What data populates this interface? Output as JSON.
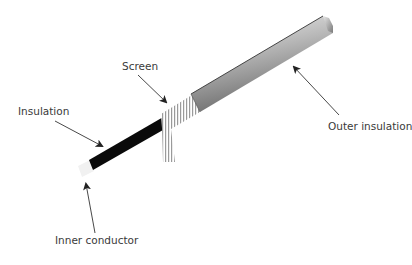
{
  "diagram": {
    "labels": {
      "insulation": "Insulation",
      "screen": "Screen",
      "outer_insulation": "Outer insulation",
      "inner_conductor": "Inner conductor"
    },
    "colors": {
      "outer_insulation_light": "#f2f2f2",
      "outer_insulation_dark": "#6e6e6e",
      "insulation": "#0a0a0a",
      "screen": "#9a9a9a",
      "inner_conductor": "#f1f1f1",
      "arrow": "#333333",
      "text": "#3a3a3a"
    }
  }
}
